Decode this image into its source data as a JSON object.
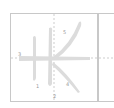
{
  "diagram": {
    "type": "character-stroke-order",
    "stroke_numbers": [
      "1",
      "2",
      "3",
      "4",
      "5"
    ],
    "colors": {
      "stroke": "#dcdcdc",
      "grid_border": "#c8c8c8",
      "guide_dash": "#c0c0c0",
      "label": "#9a9a9a"
    }
  }
}
